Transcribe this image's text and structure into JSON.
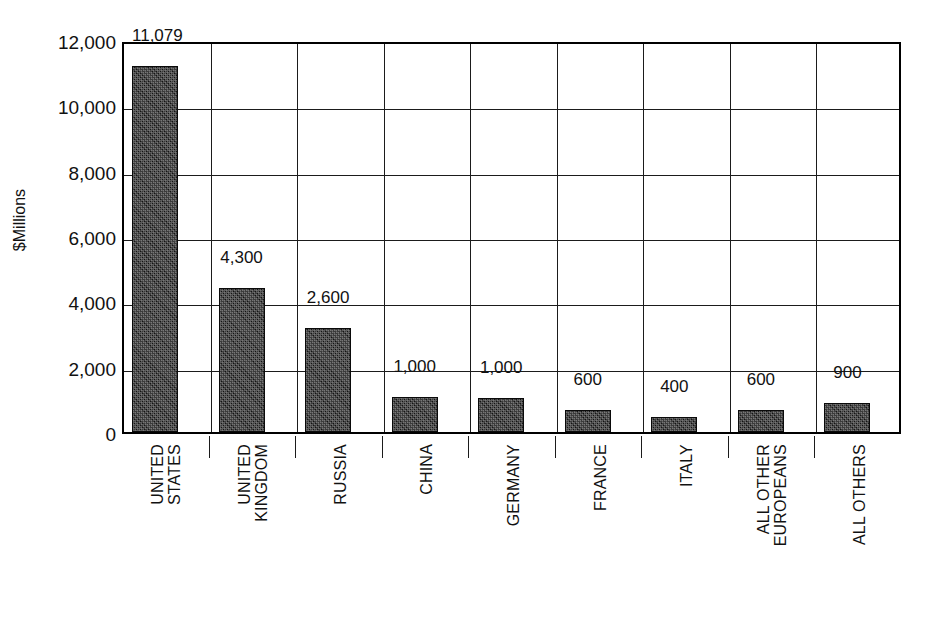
{
  "chart_data": {
    "type": "bar",
    "title": "",
    "xlabel": "",
    "ylabel": "$Millions",
    "ylim": [
      0,
      12000
    ],
    "ytick_labels": [
      "0",
      "2,000",
      "4,000",
      "6,000",
      "8,000",
      "10,000",
      "12,000"
    ],
    "ytick_values": [
      0,
      2000,
      4000,
      6000,
      8000,
      10000,
      12000
    ],
    "grid": true,
    "legend": "none",
    "categories": [
      "UNITED STATES",
      "UNITED KINGDOM",
      "RUSSIA",
      "CHINA",
      "GERMANY",
      "FRANCE",
      "ITALY",
      "ALL OTHER EUROPEANS",
      "ALL OTHERS"
    ],
    "category_label_lines": [
      [
        "UNITED",
        "STATES"
      ],
      [
        "UNITED",
        "KINGDOM"
      ],
      [
        "RUSSIA"
      ],
      [
        "CHINA"
      ],
      [
        "GERMANY"
      ],
      [
        "FRANCE"
      ],
      [
        "ITALY"
      ],
      [
        "ALL OTHER",
        "EUROPEANS"
      ],
      [
        "ALL OTHERS"
      ]
    ],
    "values": [
      11079,
      4300,
      2600,
      1000,
      1000,
      600,
      400,
      600,
      900
    ],
    "value_labels": [
      "11,079",
      "4,300",
      "2,600",
      "1,000",
      "1,000",
      "600",
      "400",
      "600",
      "900"
    ],
    "drawn_heights": [
      11200,
      4400,
      3180,
      1080,
      1050,
      680,
      460,
      660,
      900
    ],
    "bar_color": "#2b2b2b",
    "axis_color": "#000000",
    "grid_color": "#1b1b1b",
    "background_color": "#ffffff"
  }
}
